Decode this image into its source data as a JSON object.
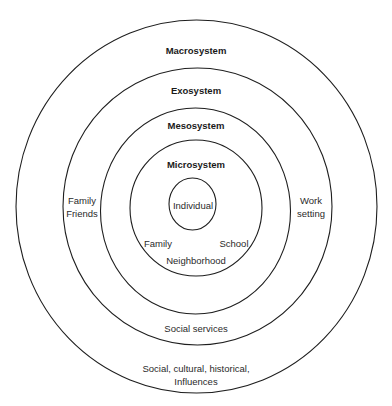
{
  "diagram": {
    "type": "concentric-circles",
    "colors": {
      "stroke": "#1e1e1e",
      "text": "#1a1a1a",
      "background": "#ffffff"
    },
    "layers": [
      {
        "name": "Macrosystem",
        "examples": [
          "Social, cultural, historical,",
          "Influences"
        ]
      },
      {
        "name": "Exosystem",
        "examples_left": [
          "Family",
          "Friends"
        ],
        "examples_right": [
          "Work",
          "setting"
        ],
        "examples_bottom": "Social services"
      },
      {
        "name": "Mesosystem"
      },
      {
        "name": "Microsystem",
        "examples": [
          "Family",
          "School",
          "Neighborhood"
        ]
      },
      {
        "name": "Individual"
      }
    ]
  },
  "labels": {
    "macrosystem": "Macrosystem",
    "exosystem": "Exosystem",
    "mesosystem": "Mesosystem",
    "microsystem": "Microsystem",
    "individual": "Individual",
    "exo_left_1": "Family",
    "exo_left_2": "Friends",
    "exo_right_1": "Work",
    "exo_right_2": "setting",
    "micro_family": "Family",
    "micro_school": "School",
    "micro_neighborhood": "Neighborhood",
    "exo_bottom": "Social services",
    "macro_bottom_1": "Social, cultural, historical,",
    "macro_bottom_2": "Influences"
  }
}
